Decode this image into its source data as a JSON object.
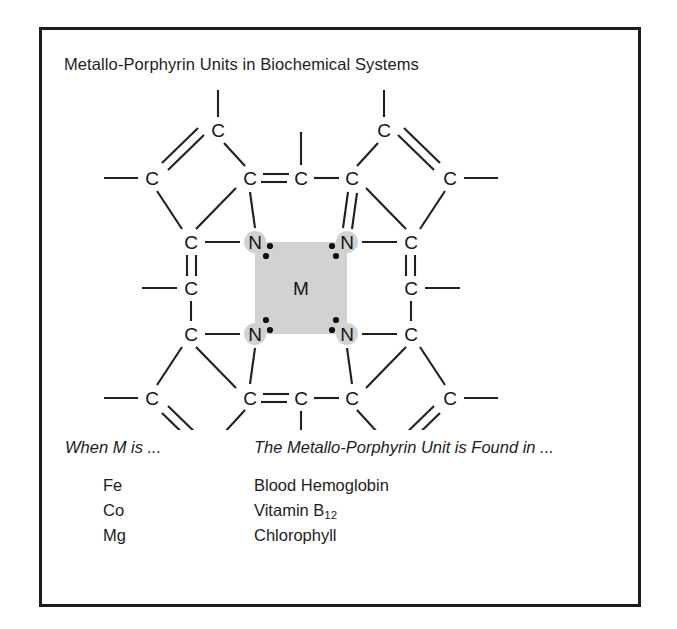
{
  "figure": {
    "title": "Metallo-Porphyrin Units in Biochemical Systems",
    "border_color": "#1c1c1c",
    "background_color": "#ffffff"
  },
  "structure": {
    "name": "metallo-porphyrin-ring",
    "center_metal_label": "M",
    "center_highlight_color": "#d2d2d2",
    "nitrogen_label": "N",
    "carbon_label": "C",
    "nitrogen_count": 4,
    "lone_pairs_per_nitrogen": 2,
    "bond_color": "#1f1f1f",
    "atoms": [
      {
        "id": "N-top-left",
        "label": "N",
        "x": 213,
        "y": 152
      },
      {
        "id": "N-top-right",
        "label": "N",
        "x": 305,
        "y": 152
      },
      {
        "id": "N-bottom-left",
        "label": "N",
        "x": 213,
        "y": 244
      },
      {
        "id": "N-bottom-right",
        "label": "N",
        "x": 305,
        "y": 244
      },
      {
        "id": "C-meso-top",
        "label": "C",
        "x": 259,
        "y": 88
      },
      {
        "id": "C-meso-bottom",
        "label": "C",
        "x": 259,
        "y": 308
      },
      {
        "id": "C-meso-left",
        "label": "C",
        "x": 149,
        "y": 198
      },
      {
        "id": "C-meso-right",
        "label": "C",
        "x": 369,
        "y": 198
      },
      {
        "id": "C-a-tl",
        "label": "C",
        "x": 208,
        "y": 88
      },
      {
        "id": "C-a-tr",
        "label": "C",
        "x": 310,
        "y": 88
      },
      {
        "id": "C-b-tl",
        "label": "C",
        "x": 176,
        "y": 40
      },
      {
        "id": "C-b-tr",
        "label": "C",
        "x": 342,
        "y": 40
      },
      {
        "id": "C-c-tl",
        "label": "C",
        "x": 110,
        "y": 88
      },
      {
        "id": "C-c-tr",
        "label": "C",
        "x": 408,
        "y": 88
      },
      {
        "id": "C-a-ltop",
        "label": "C",
        "x": 149,
        "y": 152
      },
      {
        "id": "C-a-lbot",
        "label": "C",
        "x": 149,
        "y": 244
      },
      {
        "id": "C-a-rtop",
        "label": "C",
        "x": 369,
        "y": 152
      },
      {
        "id": "C-a-rbot",
        "label": "C",
        "x": 369,
        "y": 244
      },
      {
        "id": "C-a-bl",
        "label": "C",
        "x": 208,
        "y": 308
      },
      {
        "id": "C-a-br",
        "label": "C",
        "x": 310,
        "y": 308
      },
      {
        "id": "C-b-bl",
        "label": "C",
        "x": 176,
        "y": 356
      },
      {
        "id": "C-b-br",
        "label": "C",
        "x": 342,
        "y": 356
      },
      {
        "id": "C-c-bl",
        "label": "C",
        "x": 110,
        "y": 308
      },
      {
        "id": "C-c-br",
        "label": "C",
        "x": 408,
        "y": 308
      }
    ]
  },
  "legend": {
    "header_metal": "When M is ...",
    "header_found": "The Metallo-Porphyrin Unit is Found in ...",
    "rows": [
      {
        "metal": "Fe",
        "found": "Blood Hemoglobin",
        "subscript": ""
      },
      {
        "metal": "Co",
        "found": "Vitamin B",
        "subscript": "12"
      },
      {
        "metal": "Mg",
        "found": "Chlorophyll",
        "subscript": ""
      }
    ]
  }
}
